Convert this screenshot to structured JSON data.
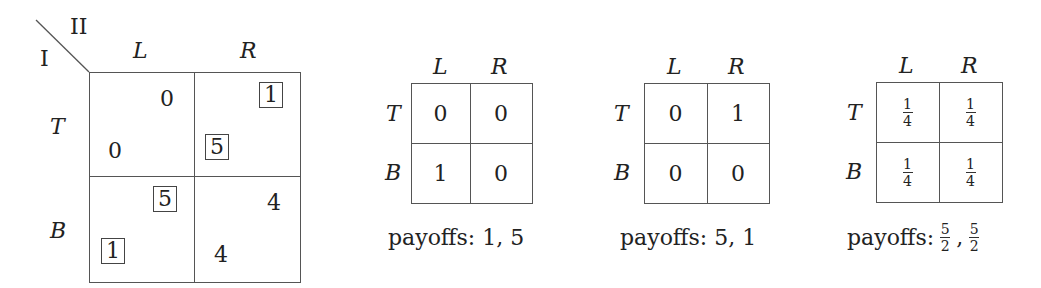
{
  "main_game": {
    "player_row": "I",
    "player_col": "II",
    "col_labels": [
      "L",
      "R"
    ],
    "row_labels": [
      "T",
      "B"
    ],
    "cells": [
      [
        {
          "p1": "0",
          "p2": "0",
          "p1_boxed": false,
          "p2_boxed": false
        },
        {
          "p1": "5",
          "p2": "1",
          "p1_boxed": true,
          "p2_boxed": true
        }
      ],
      [
        {
          "p1": "1",
          "p2": "5",
          "p1_boxed": true,
          "p2_boxed": true
        },
        {
          "p1": "4",
          "p2": "4",
          "p1_boxed": false,
          "p2_boxed": false
        }
      ]
    ]
  },
  "distributions": [
    {
      "col_labels": [
        "L",
        "R"
      ],
      "row_labels": [
        "T",
        "B"
      ],
      "cells": [
        [
          "0",
          "0"
        ],
        [
          "1",
          "0"
        ]
      ],
      "caption_label": "payoffs:",
      "caption_value": "1, 5"
    },
    {
      "col_labels": [
        "L",
        "R"
      ],
      "row_labels": [
        "T",
        "B"
      ],
      "cells": [
        [
          "0",
          "1"
        ],
        [
          "0",
          "0"
        ]
      ],
      "caption_label": "payoffs:",
      "caption_value": "5, 1"
    },
    {
      "col_labels": [
        "L",
        "R"
      ],
      "row_labels": [
        "T",
        "B"
      ],
      "cells": [
        [
          {
            "num": "1",
            "den": "4"
          },
          {
            "num": "1",
            "den": "4"
          }
        ],
        [
          {
            "num": "1",
            "den": "4"
          },
          {
            "num": "1",
            "den": "4"
          }
        ]
      ],
      "caption_label": "payoffs:",
      "caption_fracs": [
        {
          "num": "5",
          "den": "2"
        },
        {
          "num": "5",
          "den": "2"
        }
      ]
    }
  ]
}
